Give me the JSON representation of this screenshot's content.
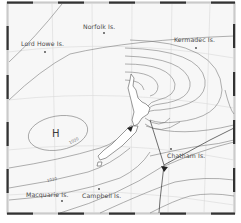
{
  "map": {
    "type": "weather-isobar-map",
    "region": "New Zealand and surrounding Tasman Sea / SW Pacific",
    "pressure_system": {
      "label": "H",
      "type": "high"
    },
    "isobar_labels": [
      "1020",
      "1020"
    ],
    "places": [
      {
        "id": "norfolk",
        "label": "Norfolk Is."
      },
      {
        "id": "lord-howe",
        "label": "Lord Howe Is."
      },
      {
        "id": "kermadec",
        "label": "Kermadec Is."
      },
      {
        "id": "chatham",
        "label": "Chatham Is."
      },
      {
        "id": "macquarie",
        "label": "Macquarie Is."
      },
      {
        "id": "campbell",
        "label": "Campbell Is."
      }
    ],
    "colors": {
      "background": "#f7f7f7",
      "frame_dark": "#333333",
      "frame_light": "#ffffff",
      "isobar": "#6b6b6b",
      "graticule": "#d6d6d6",
      "text": "#4a4a4a"
    }
  }
}
